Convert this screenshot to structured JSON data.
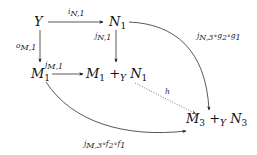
{
  "diagram": {
    "type": "commutative-diagram",
    "nodes": {
      "Y": {
        "text": "Y"
      },
      "N1": {
        "base": "N",
        "sub": "1"
      },
      "M1": {
        "base": "M",
        "sub": "1"
      },
      "M1_plus_N1": {
        "left_base": "M",
        "left_sub": "1",
        "op": "+",
        "op_sub": "Y",
        "right_base": "N",
        "right_sub": "1"
      },
      "M3_plus_N3": {
        "left_base": "M",
        "left_sub": "3",
        "op": "+",
        "op_sub": "Y",
        "right_base": "N",
        "right_sub": "3"
      }
    },
    "arrows": [
      {
        "id": "i_N1",
        "from": "Y",
        "to": "N1",
        "label": "i_{N,1}",
        "style": "solid"
      },
      {
        "id": "o_M1",
        "from": "Y",
        "to": "M1",
        "label": "o_{M,1}",
        "style": "solid"
      },
      {
        "id": "j_N1",
        "from": "N1",
        "to": "M1_plus_N1",
        "label": "j_{N,1}",
        "style": "solid"
      },
      {
        "id": "j_M1",
        "from": "M1",
        "to": "M1_plus_N1",
        "label": "j_{M,1}",
        "style": "solid"
      },
      {
        "id": "top_curve",
        "from": "N1",
        "to": "M3_plus_N3",
        "label": "j_{N,3}∘g_2∘g_1",
        "style": "solid-curved"
      },
      {
        "id": "bottom_curve",
        "from": "M1",
        "to": "M3_plus_N3",
        "label": "j_{M,3}∘f_2∘f_1",
        "style": "solid-curved"
      },
      {
        "id": "h",
        "from": "M1_plus_N1",
        "to": "M3_plus_N3",
        "label": "h",
        "style": "dotted"
      }
    ],
    "labels": {
      "i_N1": "i",
      "i_N1_sub": "N,1",
      "o_M1": "o",
      "o_M1_sub": "M,1",
      "j_N1": "j",
      "j_N1_sub": "N,1",
      "j_M1": "j",
      "j_M1_sub": "M,1",
      "top_curve_a": "j",
      "top_curve_a_sub": "N,3",
      "top_curve_b": "∘g",
      "top_curve_b_sub": "2",
      "top_curve_c": "∘g",
      "top_curve_c_sub": "1",
      "bottom_curve_a": "j",
      "bottom_curve_a_sub": "M,3",
      "bottom_curve_b": "∘f",
      "bottom_curve_b_sub": "2",
      "bottom_curve_c": "∘f",
      "bottom_curve_c_sub": "1",
      "h": "h"
    },
    "colors": {
      "ink": "#111111",
      "dotted": "#555555",
      "background": "#ffffff"
    }
  }
}
